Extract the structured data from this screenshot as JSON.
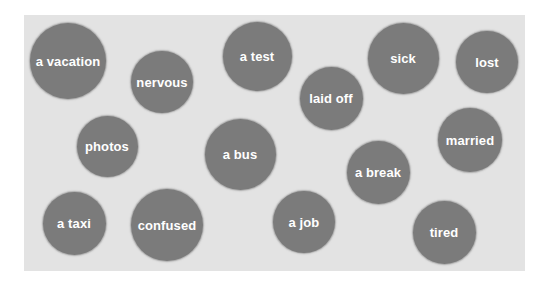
{
  "colors": {
    "page_background": "#ffffff",
    "panel_background": "#e3e3e3",
    "bubble_fill": "#7b7b7b",
    "bubble_text": "#ffffff"
  },
  "bubbles": [
    {
      "label": "a vacation",
      "cx": 68,
      "cy": 61,
      "d": 76
    },
    {
      "label": "nervous",
      "cx": 162,
      "cy": 82,
      "d": 62
    },
    {
      "label": "a test",
      "cx": 257,
      "cy": 56,
      "d": 69
    },
    {
      "label": "laid off",
      "cx": 331,
      "cy": 98,
      "d": 63
    },
    {
      "label": "sick",
      "cx": 403,
      "cy": 58,
      "d": 71
    },
    {
      "label": "lost",
      "cx": 487,
      "cy": 62,
      "d": 62
    },
    {
      "label": "photos",
      "cx": 107,
      "cy": 146,
      "d": 61
    },
    {
      "label": "a bus",
      "cx": 240,
      "cy": 154,
      "d": 71
    },
    {
      "label": "married",
      "cx": 470,
      "cy": 140,
      "d": 64
    },
    {
      "label": "a break",
      "cx": 378,
      "cy": 172,
      "d": 63
    },
    {
      "label": "a taxi",
      "cx": 74,
      "cy": 223,
      "d": 63
    },
    {
      "label": "confused",
      "cx": 167,
      "cy": 225,
      "d": 72
    },
    {
      "label": "a job",
      "cx": 304,
      "cy": 222,
      "d": 62
    },
    {
      "label": "tired",
      "cx": 444,
      "cy": 232,
      "d": 63
    }
  ]
}
